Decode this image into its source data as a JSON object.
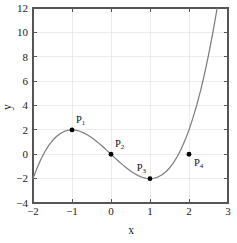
{
  "chart_data": {
    "type": "line",
    "title": "",
    "xlabel": "x",
    "ylabel": "y",
    "xlim": [
      -2,
      3
    ],
    "ylim": [
      -4,
      12
    ],
    "xticks": [
      -2,
      -1,
      0,
      1,
      2,
      3
    ],
    "xtick_labels": [
      "−2",
      "−1",
      "0",
      "1",
      "2",
      "3"
    ],
    "yticks": [
      -4,
      -2,
      0,
      2,
      4,
      6,
      8,
      10,
      12
    ],
    "ytick_labels": [
      "−4",
      "−2",
      "0",
      "2",
      "4",
      "6",
      "8",
      "10",
      "12"
    ],
    "grid": true,
    "legend": false,
    "curve_color": "#7d7d7d",
    "marker_color": "#000000",
    "grid_color": "#e2e2e2",
    "axis_color": "#555555",
    "series": [
      {
        "name": "cubic",
        "expression": "y = x^3 - 3x",
        "x": [
          -2,
          -1.9,
          -1.8,
          -1.7,
          -1.6,
          -1.5,
          -1.4,
          -1.3,
          -1.2,
          -1.1,
          -1,
          -0.9,
          -0.8,
          -0.7,
          -0.6,
          -0.5,
          -0.4,
          -0.3,
          -0.2,
          -0.1,
          0,
          0.1,
          0.2,
          0.3,
          0.4,
          0.5,
          0.6,
          0.7,
          0.8,
          0.9,
          1,
          1.1,
          1.2,
          1.3,
          1.4,
          1.5,
          1.6,
          1.7,
          1.8,
          1.9,
          2,
          2.1,
          2.2,
          2.3,
          2.4,
          2.5,
          2.6,
          2.7,
          2.8,
          2.9,
          3
        ],
        "y": [
          -2,
          -1.159,
          -0.432,
          0.187,
          0.704,
          1.125,
          1.456,
          1.703,
          1.872,
          1.969,
          2,
          1.971,
          1.888,
          1.757,
          1.584,
          1.375,
          1.136,
          0.873,
          0.592,
          0.299,
          0,
          -0.299,
          -0.592,
          -0.873,
          -1.136,
          -1.375,
          -1.584,
          -1.757,
          -1.888,
          -1.971,
          -2,
          -1.969,
          -1.872,
          -1.703,
          -1.456,
          -1.125,
          -0.704,
          -0.187,
          0.432,
          1.159,
          2,
          2.961,
          4.048,
          5.267,
          6.624,
          8.125,
          9.776,
          11.583,
          13.552,
          15.689,
          18
        ]
      }
    ],
    "points": [
      {
        "label": "P",
        "subscript": "1",
        "x": -1,
        "y": 2,
        "label_dx": 4,
        "label_dy": -7
      },
      {
        "label": "P",
        "subscript": "2",
        "x": 0,
        "y": 0,
        "label_dx": 4,
        "label_dy": -7
      },
      {
        "label": "P",
        "subscript": "3",
        "x": 1,
        "y": -2,
        "label_dx": -4,
        "label_dy": -8
      },
      {
        "label": "P",
        "subscript": "4",
        "x": 2,
        "y": 0,
        "label_dx": 5,
        "label_dy": 12
      }
    ]
  }
}
